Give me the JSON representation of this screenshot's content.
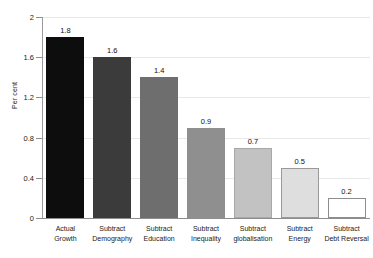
{
  "chart_data": {
    "type": "bar",
    "title": "",
    "xlabel": "",
    "ylabel": "Per cent",
    "ylim": [
      0,
      2
    ],
    "yticks": [
      "0",
      "0.4",
      "0.8",
      "1.2",
      "1.6",
      "2"
    ],
    "ytick_values": [
      0,
      0.4,
      0.8,
      1.2,
      1.6,
      2
    ],
    "grid": true,
    "legend": "none",
    "categories": [
      "Actual\nGrowth",
      "Subtract\nDemography",
      "Subtract\nEducation",
      "Subtract\nInequality",
      "Subtract\nglobalisation",
      "Subtract\nEnergy",
      "Subtract\nDebt Reversal"
    ],
    "values": [
      1.8,
      1.6,
      1.4,
      0.9,
      0.7,
      0.5,
      0.2
    ],
    "value_labels": [
      "1.8",
      "1.6",
      "1.4",
      "0.9",
      "0.7",
      "0.5",
      "0.2"
    ],
    "bar_colors": [
      "#0d0d0d",
      "#3b3b3b",
      "#6e6e6e",
      "#8f8f8f",
      "#c2c2c2",
      "#dedede",
      "#ffffff"
    ],
    "bar_border_colors": [
      "#0d0d0d",
      "#3b3b3b",
      "#6e6e6e",
      "#8f8f8f",
      "#a8a8a8",
      "#9a9a9a",
      "#8d8d8d"
    ],
    "axis_color": "#8d8d8d",
    "grid_color": "#e8e8e8",
    "text_color": "#1a1a1a",
    "background": "#ffffff"
  }
}
